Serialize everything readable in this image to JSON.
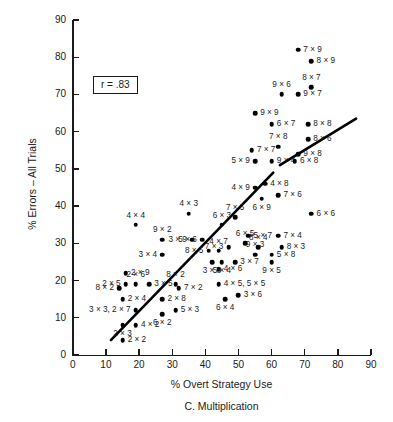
{
  "chart_data": {
    "type": "scatter",
    "title": "",
    "caption": "C. Multiplication",
    "xlabel": "% Overt Strategy Use",
    "ylabel": "% Errors – All Trials",
    "xlim": [
      0,
      90
    ],
    "ylim": [
      0,
      90
    ],
    "xticks": [
      0,
      10,
      20,
      30,
      40,
      50,
      60,
      70,
      80,
      90
    ],
    "yticks": [
      0,
      10,
      20,
      30,
      40,
      50,
      60,
      70,
      80,
      90
    ],
    "grid": false,
    "legend": null,
    "annotations": [
      {
        "name": "correlation-box",
        "text": "r = .83",
        "x": 18,
        "y": 72
      }
    ],
    "trendline": {
      "name": "regression-line",
      "x0": 11.5,
      "y0": 4.0,
      "x1": 60.5,
      "y1": 49.0,
      "x2": 62.5,
      "y2": 51.0,
      "x3": 85.5,
      "y3": 63.5
    },
    "points": [
      {
        "label": "2 × 2",
        "x": 15,
        "y": 4,
        "pos": "right"
      },
      {
        "label": "2 × 3",
        "x": 15,
        "y": 8,
        "pos": "below"
      },
      {
        "label": "4 × 2",
        "x": 19,
        "y": 8,
        "pos": "right"
      },
      {
        "label": "6 × 2",
        "x": 27,
        "y": 11,
        "pos": "below"
      },
      {
        "label": "5 × 3",
        "x": 31,
        "y": 12,
        "pos": "right"
      },
      {
        "label": "3 × 3, 2 × 7",
        "x": 19,
        "y": 12,
        "pos": "left"
      },
      {
        "label": "2 × 4",
        "x": 15,
        "y": 15,
        "pos": "right"
      },
      {
        "label": "2 × 8",
        "x": 27,
        "y": 15,
        "pos": "right"
      },
      {
        "label": "6 × 4",
        "x": 46,
        "y": 15,
        "pos": "below"
      },
      {
        "label": "3 × 6",
        "x": 50,
        "y": 16,
        "pos": "right"
      },
      {
        "label": "4 × 5, 5 × 5",
        "x": 44,
        "y": 19,
        "pos": "right"
      },
      {
        "label": "8 × 2",
        "x": 14,
        "y": 18,
        "pos": "left"
      },
      {
        "label": "2 × 5",
        "x": 16,
        "y": 19,
        "pos": "left"
      },
      {
        "label": "2 × 6",
        "x": 19,
        "y": 19,
        "pos": "above"
      },
      {
        "label": "2 × 9",
        "x": 16,
        "y": 22,
        "pos": "right"
      },
      {
        "label": "3 × 5",
        "x": 23,
        "y": 19,
        "pos": "right"
      },
      {
        "label": "8 × 2",
        "x": 31,
        "y": 19,
        "pos": "above"
      },
      {
        "label": "7 × 2",
        "x": 32,
        "y": 18,
        "pos": "right"
      },
      {
        "label": "4 × 6",
        "x": 44,
        "y": 23,
        "pos": "right"
      },
      {
        "label": "3 × 8",
        "x": 42,
        "y": 25,
        "pos": "below"
      },
      {
        "label": "5 × 4",
        "x": 45,
        "y": 25,
        "pos": "below"
      },
      {
        "label": "3 × 7",
        "x": 49,
        "y": 25,
        "pos": "right"
      },
      {
        "label": "9 × 5",
        "x": 60,
        "y": 25,
        "pos": "below"
      },
      {
        "label": "5 × 8",
        "x": 60,
        "y": 27,
        "pos": "right"
      },
      {
        "label": "9 × 3",
        "x": 55,
        "y": 27,
        "pos": "above"
      },
      {
        "label": "8 × 5",
        "x": 41,
        "y": 28,
        "pos": "left"
      },
      {
        "label": "4 × 7",
        "x": 44,
        "y": 28,
        "pos": "above"
      },
      {
        "label": "8 × 4",
        "x": 56,
        "y": 29,
        "pos": "above"
      },
      {
        "label": "8 × 3",
        "x": 63,
        "y": 29,
        "pos": "right"
      },
      {
        "label": "7 × 3",
        "x": 47,
        "y": 29,
        "pos": "left"
      },
      {
        "label": "6 × 5",
        "x": 52,
        "y": 30,
        "pos": "above"
      },
      {
        "label": "3 × 9",
        "x": 36,
        "y": 31,
        "pos": "left"
      },
      {
        "label": "9 × 2",
        "x": 27,
        "y": 31,
        "pos": "above"
      },
      {
        "label": "5 × 6",
        "x": 39,
        "y": 31,
        "pos": "left"
      },
      {
        "label": "5 × 7",
        "x": 53,
        "y": 32,
        "pos": "right"
      },
      {
        "label": "7 × 4",
        "x": 62,
        "y": 32,
        "pos": "right"
      },
      {
        "label": "3 × 4",
        "x": 27,
        "y": 27,
        "pos": "left"
      },
      {
        "label": "6 × 3",
        "x": 45,
        "y": 35,
        "pos": "above"
      },
      {
        "label": "4 × 4",
        "x": 19,
        "y": 35,
        "pos": "above"
      },
      {
        "label": "7 × 5",
        "x": 49,
        "y": 37,
        "pos": "above"
      },
      {
        "label": "4 × 3",
        "x": 35,
        "y": 38,
        "pos": "above"
      },
      {
        "label": "6 × 6",
        "x": 72,
        "y": 38,
        "pos": "right"
      },
      {
        "label": "6 × 9",
        "x": 57,
        "y": 42,
        "pos": "below"
      },
      {
        "label": "7 × 6",
        "x": 62,
        "y": 43,
        "pos": "right"
      },
      {
        "label": "4 × 9",
        "x": 55,
        "y": 45,
        "pos": "left"
      },
      {
        "label": "4 × 8",
        "x": 58,
        "y": 46,
        "pos": "right"
      },
      {
        "label": "5 × 9",
        "x": 55,
        "y": 52,
        "pos": "left"
      },
      {
        "label": "9 × 4",
        "x": 60,
        "y": 52,
        "pos": "right"
      },
      {
        "label": "6 × 8",
        "x": 67,
        "y": 52,
        "pos": "right"
      },
      {
        "label": "7 × 7",
        "x": 54,
        "y": 55,
        "pos": "right"
      },
      {
        "label": "9 × 8",
        "x": 68,
        "y": 54,
        "pos": "right"
      },
      {
        "label": "7 × 8",
        "x": 62,
        "y": 56,
        "pos": "above"
      },
      {
        "label": "8 × 6",
        "x": 71,
        "y": 58,
        "pos": "right"
      },
      {
        "label": "6 × 7",
        "x": 60,
        "y": 62,
        "pos": "right"
      },
      {
        "label": "8 × 8",
        "x": 71,
        "y": 62,
        "pos": "right"
      },
      {
        "label": "9 × 9",
        "x": 55,
        "y": 65,
        "pos": "right"
      },
      {
        "label": "9 × 6",
        "x": 63,
        "y": 70,
        "pos": "above"
      },
      {
        "label": "9 × 7",
        "x": 68,
        "y": 70,
        "pos": "right"
      },
      {
        "label": "8 × 7",
        "x": 72,
        "y": 72,
        "pos": "above"
      },
      {
        "label": "8 × 9",
        "x": 72,
        "y": 79,
        "pos": "right"
      },
      {
        "label": "7 × 9",
        "x": 68,
        "y": 82,
        "pos": "right"
      }
    ]
  }
}
